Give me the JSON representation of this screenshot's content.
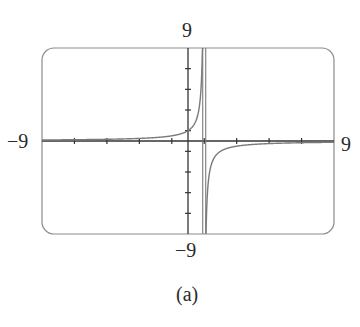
{
  "chart_data": {
    "type": "line",
    "title": "",
    "caption": "(a)",
    "function": "y = 1/(1 - x)",
    "vertical_asymptote": 1,
    "horizontal_asymptote": 0,
    "xlim": [
      -9,
      9
    ],
    "ylim": [
      -9,
      9
    ],
    "x_tick_step": 2,
    "y_tick_step": 2,
    "grid": false,
    "labels": {
      "ymax": "9",
      "ymin": "−9",
      "xmin": "−9",
      "xmax": "9"
    },
    "sample_points": [
      {
        "x": -9,
        "y": 0.1
      },
      {
        "x": -4,
        "y": 0.2
      },
      {
        "x": -2,
        "y": 0.333
      },
      {
        "x": 0,
        "y": 1
      },
      {
        "x": 0.5,
        "y": 2
      },
      {
        "x": 0.9,
        "y": 10
      },
      {
        "x": 1.1,
        "y": -10
      },
      {
        "x": 1.5,
        "y": -2
      },
      {
        "x": 2,
        "y": -1
      },
      {
        "x": 4,
        "y": -0.333
      },
      {
        "x": 9,
        "y": -0.125
      }
    ],
    "line_color": "#7a7a7a",
    "frame_color": "#8c8c8c"
  }
}
